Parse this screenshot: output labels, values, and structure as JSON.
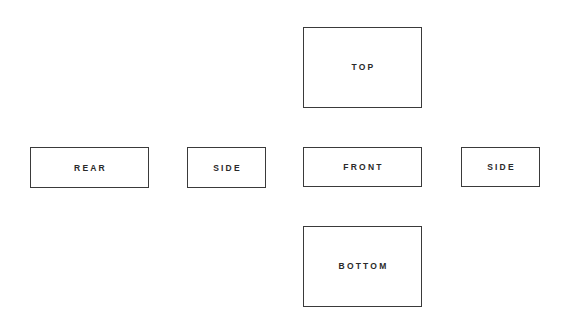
{
  "diagram": {
    "type": "orthographic-projection-views",
    "views": {
      "top": {
        "label": "TOP"
      },
      "rear": {
        "label": "REAR"
      },
      "side_left": {
        "label": "SIDE"
      },
      "front": {
        "label": "FRONT"
      },
      "side_right": {
        "label": "SIDE"
      },
      "bottom": {
        "label": "BOTTOM"
      }
    },
    "layout": {
      "rows": [
        [
          "",
          "",
          "top",
          ""
        ],
        [
          "rear",
          "side_left",
          "front",
          "side_right"
        ],
        [
          "",
          "",
          "bottom",
          ""
        ]
      ]
    },
    "colors": {
      "background": "#ffffff",
      "border": "#3a3a3a",
      "text": "#2a2a2a"
    }
  }
}
